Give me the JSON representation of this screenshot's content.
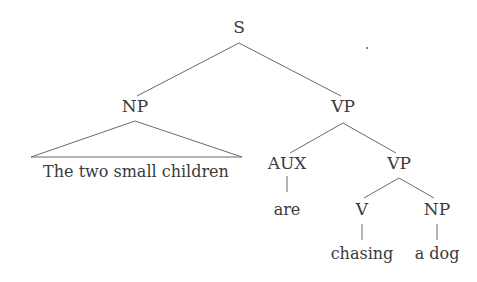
{
  "diagram": {
    "type": "syntax-tree",
    "nodes": {
      "s": {
        "label": "S",
        "x": 239,
        "y": 27
      },
      "np": {
        "label": "NP",
        "x": 135,
        "y": 106
      },
      "vp": {
        "label": "VP",
        "x": 343,
        "y": 106
      },
      "aux": {
        "label": "AUX",
        "x": 287,
        "y": 163
      },
      "vp2": {
        "label": "VP",
        "x": 399,
        "y": 163
      },
      "v": {
        "label": "V",
        "x": 362,
        "y": 209
      },
      "np2": {
        "label": "NP",
        "x": 437,
        "y": 209
      }
    },
    "leaves": {
      "np_phrase": {
        "label": "The two small children",
        "x": 136,
        "y": 172
      },
      "are": {
        "label": "are",
        "x": 287,
        "y": 210
      },
      "chasing": {
        "label": "chasing",
        "x": 362,
        "y": 254
      },
      "a_dog": {
        "label": "a dog",
        "x": 437,
        "y": 254
      }
    },
    "edges": [
      [
        "S",
        "NP"
      ],
      [
        "S",
        "VP"
      ],
      [
        "NP",
        "The two small children (triangle)"
      ],
      [
        "VP",
        "AUX"
      ],
      [
        "VP",
        "VP"
      ],
      [
        "AUX",
        "are"
      ],
      [
        "VP",
        "V"
      ],
      [
        "VP",
        "NP"
      ],
      [
        "V",
        "chasing"
      ],
      [
        "NP",
        "a dog"
      ]
    ],
    "colors": {
      "line": "#6a6a6a",
      "text": "#3a3a3a",
      "background": "#ffffff"
    }
  }
}
